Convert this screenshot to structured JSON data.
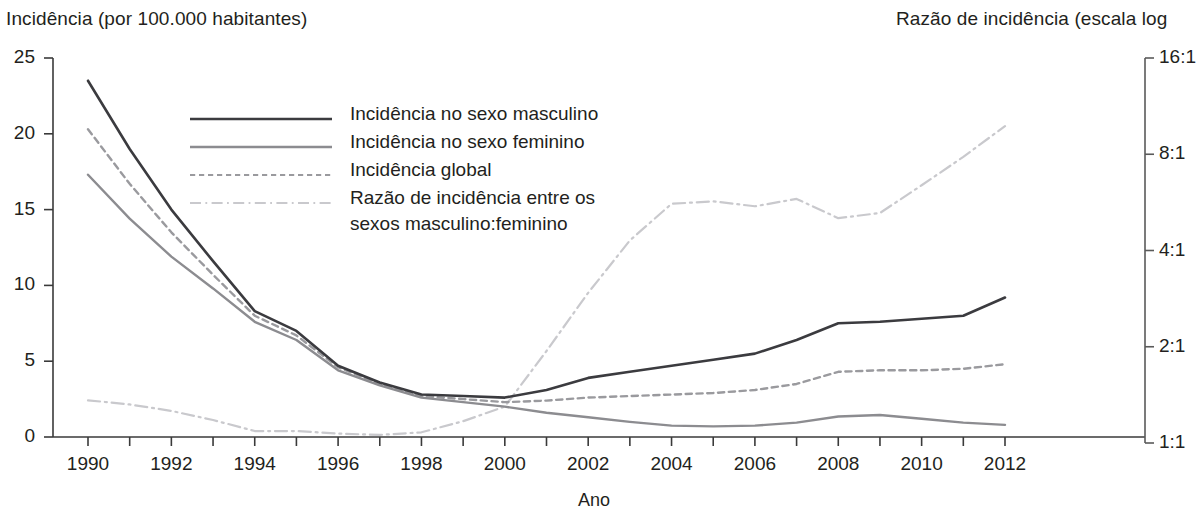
{
  "chart_data": {
    "type": "line",
    "title": "",
    "ylabel": "Incidência (por 100.000 habitantes)",
    "ylabel_right": "Razão de incidência (escala log",
    "xlabel": "Ano",
    "x": [
      1990,
      1991,
      1992,
      1993,
      1994,
      1995,
      1996,
      1997,
      1998,
      1999,
      2000,
      2001,
      2002,
      2003,
      2004,
      2005,
      2006,
      2007,
      2008,
      2009,
      2010,
      2011,
      2012
    ],
    "xlim": [
      1990,
      2012
    ],
    "ylim": [
      0,
      25
    ],
    "ylim_right": [
      1,
      16
    ],
    "right_scale": "log2",
    "grid": false,
    "legend_position": "upper-left-inside",
    "xticks": [
      1990,
      1991,
      1992,
      1993,
      1994,
      1995,
      1996,
      1997,
      1998,
      1999,
      2000,
      2001,
      2002,
      2003,
      2004,
      2005,
      2006,
      2007,
      2008,
      2009,
      2010,
      2011,
      2012
    ],
    "xtick_labels": [
      "1990",
      "",
      "1992",
      "",
      "1994",
      "",
      "1996",
      "",
      "1998",
      "",
      "2000",
      "",
      "2002",
      "",
      "2004",
      "",
      "2006",
      "",
      "2008",
      "",
      "2010",
      "",
      "2012"
    ],
    "yticks_left": [
      0,
      5,
      10,
      15,
      20,
      25
    ],
    "ytick_labels_left": [
      "0",
      "5",
      "10",
      "15",
      "20",
      "25"
    ],
    "yticks_right": [
      1,
      2,
      4,
      8,
      16
    ],
    "ytick_labels_right": [
      "1:1",
      "2:1",
      "4:1",
      "8:1",
      "16:1"
    ],
    "series": [
      {
        "name": "Incidência no sexo masculino",
        "axis": "left",
        "style": "solid",
        "color": "#3b3b3f",
        "width": 2.6,
        "values": [
          23.5,
          19.0,
          15.0,
          11.6,
          8.3,
          7.0,
          4.7,
          3.6,
          2.8,
          2.7,
          2.6,
          3.1,
          3.9,
          4.3,
          4.7,
          5.1,
          5.5,
          6.4,
          7.5,
          7.6,
          7.8,
          8.0,
          9.2
        ]
      },
      {
        "name": "Incidência no sexo feminino",
        "axis": "left",
        "style": "solid",
        "color": "#8c8c90",
        "width": 2.4,
        "values": [
          17.3,
          14.4,
          11.9,
          9.8,
          7.6,
          6.4,
          4.4,
          3.4,
          2.6,
          2.3,
          2.0,
          1.6,
          1.3,
          1.0,
          0.75,
          0.7,
          0.75,
          0.95,
          1.35,
          1.45,
          1.2,
          0.95,
          0.8
        ]
      },
      {
        "name": "Incidência global",
        "axis": "left",
        "style": "dashed",
        "color": "#9a9a9e",
        "width": 2.4,
        "values": [
          20.3,
          16.7,
          13.5,
          10.7,
          8.0,
          6.7,
          4.6,
          3.5,
          2.7,
          2.5,
          2.3,
          2.4,
          2.6,
          2.7,
          2.8,
          2.9,
          3.1,
          3.5,
          4.3,
          4.4,
          4.4,
          4.5,
          4.8
        ]
      },
      {
        "name": "Razão de incidência entre os sexos masculino:feminino",
        "axis": "right",
        "style": "dashdot",
        "color": "#c9c9cd",
        "width": 2.2,
        "values": [
          1.36,
          1.32,
          1.26,
          1.18,
          1.09,
          1.09,
          1.07,
          1.06,
          1.08,
          1.17,
          1.3,
          1.94,
          2.95,
          4.3,
          5.6,
          5.7,
          5.5,
          5.8,
          5.05,
          5.24,
          6.4,
          7.85,
          9.8
        ]
      }
    ],
    "legend": [
      {
        "label": "Incidência no sexo masculino",
        "style": "solid",
        "color": "#3b3b3f",
        "width": 2.6
      },
      {
        "label": "Incidência no sexo feminino",
        "style": "solid",
        "color": "#8c8c90",
        "width": 2.4
      },
      {
        "label": "Incidência global",
        "style": "dashed",
        "color": "#9a9a9e",
        "width": 2.0
      },
      {
        "label": "Razão de incidência entre os",
        "label2": "sexos masculino:feminino",
        "style": "dashdot",
        "color": "#c9c9cd",
        "width": 2.0
      }
    ]
  }
}
